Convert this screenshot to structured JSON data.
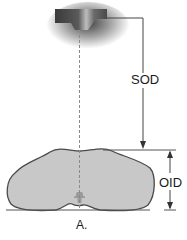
{
  "diagram": {
    "labels": {
      "sod": "SOD",
      "oid": "OID",
      "caption": "A."
    },
    "elements": [
      "x-ray-tube-head",
      "central-ray-dashed",
      "object-body-cross-section",
      "image-receptor-baseline"
    ],
    "colors": {
      "tube_dark": "#3a3a3a",
      "body_fill": "#c8c8c8",
      "body_outline": "#4a4a4a",
      "line": "#444444",
      "dash": "#8a8a8a"
    }
  }
}
